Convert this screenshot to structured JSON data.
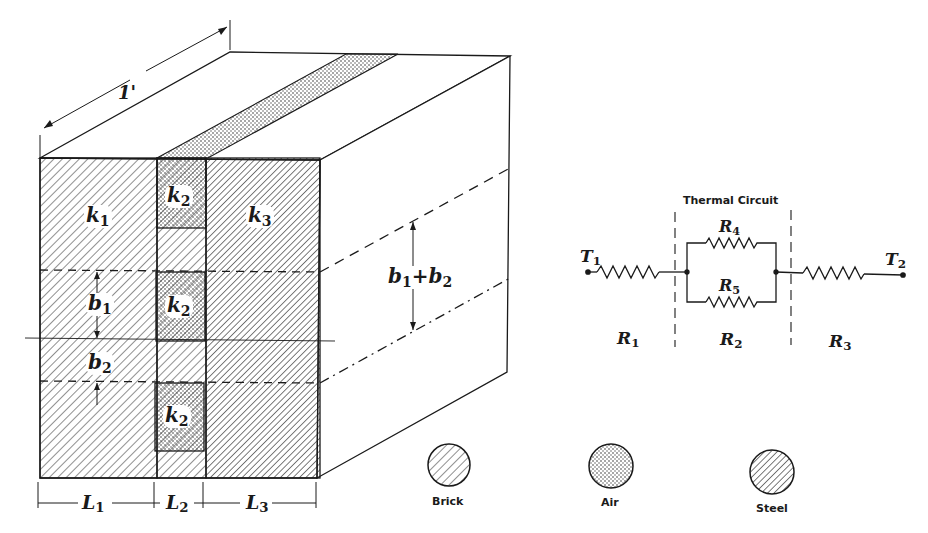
{
  "figure": {
    "depth_dimension": "1'",
    "block": {
      "conductivities": {
        "k1": {
          "sym": "k",
          "sub": "1"
        },
        "k2": {
          "sym": "k",
          "sub": "2"
        },
        "k3": {
          "sym": "k",
          "sub": "3"
        }
      },
      "heights": {
        "b1": {
          "sym": "b",
          "sub": "1"
        },
        "b2": {
          "sym": "b",
          "sub": "2"
        },
        "b1_plus_b2": {
          "a": "b",
          "a_sub": "1",
          "op": "+",
          "b": "b",
          "b_sub": "2"
        }
      },
      "lengths": {
        "L1": {
          "sym": "L",
          "sub": "1"
        },
        "L2": {
          "sym": "L",
          "sub": "2"
        },
        "L3": {
          "sym": "L",
          "sub": "3"
        }
      }
    },
    "circuit": {
      "title": "Thermal Circuit",
      "T1": {
        "sym": "T",
        "sub": "1"
      },
      "T2": {
        "sym": "T",
        "sub": "2"
      },
      "R1": {
        "sym": "R",
        "sub": "1"
      },
      "R2": {
        "sym": "R",
        "sub": "2"
      },
      "R3": {
        "sym": "R",
        "sub": "3"
      },
      "R4": {
        "sym": "R",
        "sub": "4"
      },
      "R5": {
        "sym": "R",
        "sub": "5"
      }
    },
    "legend": [
      {
        "label": "Brick",
        "pattern": "hatch"
      },
      {
        "label": "Air",
        "pattern": "dots"
      },
      {
        "label": "Steel",
        "pattern": "hatch-dense"
      }
    ],
    "colors": {
      "ink": "#1a1a1a",
      "paper": "#ffffff"
    }
  }
}
